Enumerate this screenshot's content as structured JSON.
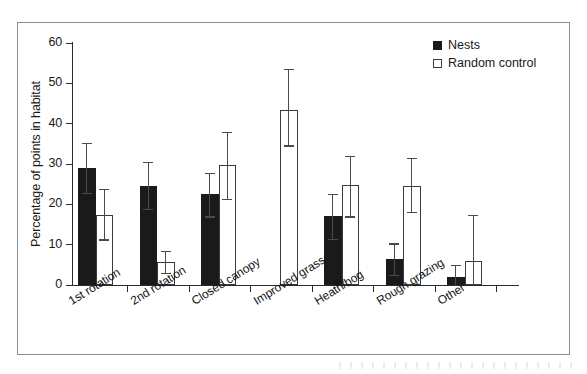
{
  "chart_data": {
    "type": "bar",
    "title": "",
    "xlabel": "",
    "ylabel": "Percentage of points in habitat",
    "ylim": [
      0,
      60
    ],
    "yticks": [
      0,
      10,
      20,
      30,
      40,
      50,
      60
    ],
    "grid": false,
    "legend_position": "top-right",
    "categories": [
      "1st rotation",
      "2nd rotation",
      "Closed canopy",
      "Improved grass",
      "Heath/bog",
      "Rough grazing",
      "Other"
    ],
    "series": [
      {
        "name": "Nests",
        "style": "filled",
        "color": "#1a1a1a",
        "values": [
          29.0,
          24.5,
          22.5,
          0.0,
          17.0,
          6.5,
          2.0
        ],
        "error_low": [
          22.8,
          18.8,
          17.0,
          0.0,
          11.5,
          2.5,
          0.0
        ],
        "error_high": [
          35.3,
          30.5,
          27.8,
          0.0,
          22.5,
          10.3,
          5.0
        ]
      },
      {
        "name": "Random control",
        "style": "open",
        "color": "#ffffff",
        "values": [
          17.3,
          5.8,
          29.8,
          43.5,
          24.8,
          24.6,
          6.0
        ],
        "error_low": [
          11.3,
          3.0,
          21.3,
          34.6,
          17.0,
          18.0,
          0.0
        ],
        "error_high": [
          23.8,
          8.5,
          38.0,
          53.5,
          32.0,
          31.5,
          17.3
        ]
      }
    ],
    "legend": [
      {
        "label": "Nests",
        "swatch": "filled-square"
      },
      {
        "label": "Random control",
        "swatch": "open-square"
      }
    ]
  },
  "figure": {
    "frame_color": "#8d8d8d",
    "axis_color": "#2b2b2b",
    "error_bar_color": "#4a4a4a"
  }
}
